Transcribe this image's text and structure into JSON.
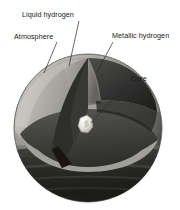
{
  "figure": {
    "background_color": "#ffffff",
    "label_color": "#1a1a1a",
    "leader_line_color": "#2b2b2b"
  },
  "labels": {
    "liquid_hydrogen": "Liquid hydrogen",
    "atmosphere": "Atmosphere",
    "metallic_hydrogen": "Metallic hydrogen",
    "core": "Core"
  },
  "layers": [
    {
      "name": "atmosphere",
      "label": "Atmosphere",
      "color": "#b9b7b2",
      "order": 1
    },
    {
      "name": "liquid-hydrogen",
      "label": "Liquid hydrogen",
      "color": "#9b9a96",
      "order": 2
    },
    {
      "name": "metallic-hydrogen",
      "label": "Metallic hydrogen",
      "color": "#3d3d3d",
      "order": 3
    },
    {
      "name": "core",
      "label": "Core",
      "color": "#f2f0ea",
      "order": 4
    }
  ],
  "sphere": {
    "center_x": 88,
    "center_y": 128,
    "radius": 74,
    "body_color": "#8d8c87",
    "shadow_color": "#24241f"
  }
}
